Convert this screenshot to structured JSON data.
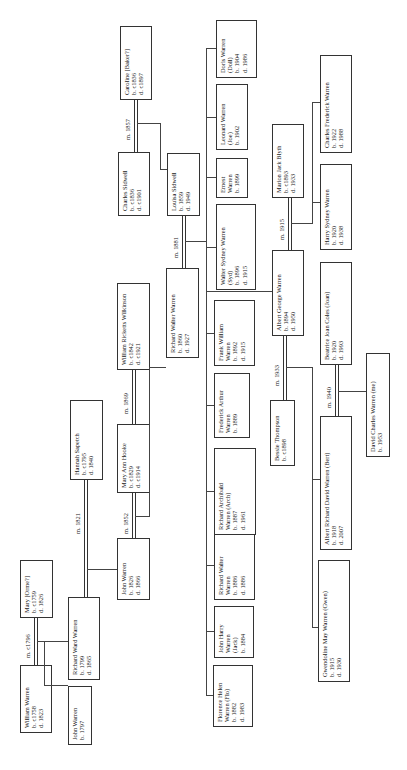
{
  "diagram": {
    "type": "family-tree",
    "orientation": "rotated 90 degrees counter-clockwise",
    "people": [
      {
        "id": "caroline",
        "lines": [
          "Caroline [Baker?]",
          "b. c1836",
          "d. c1897"
        ]
      },
      {
        "id": "charles_sidwell",
        "lines": [
          "Charles Sidwell",
          "b. c1836",
          "d. c1901"
        ]
      },
      {
        "id": "louisa_sidwell",
        "lines": [
          "Louisa Sidwell",
          "b. 1859",
          "d. 1949"
        ]
      },
      {
        "id": "doris",
        "lines": [
          "Doris Warren",
          "(Doll)",
          "b. 1904",
          "d. 1986"
        ]
      },
      {
        "id": "leonard",
        "lines": [
          "Leonard Warren",
          "(Joe)",
          "b. 1902"
        ]
      },
      {
        "id": "ernest",
        "lines": [
          "Ernest",
          "Warren",
          "b. 1899"
        ]
      },
      {
        "id": "walter_sydney",
        "lines": [
          "Walter Sydney Warren",
          "(Syd)",
          "b. 1896",
          "d. 1915"
        ]
      },
      {
        "id": "marion",
        "lines": [
          "Marion Jack Blyth",
          "b. c1893",
          "d. 1933"
        ]
      },
      {
        "id": "charles_frederick",
        "lines": [
          "Charles Frederick Warren",
          "b. 1922",
          "d. 1988"
        ]
      },
      {
        "id": "harry_sydney",
        "lines": [
          "Harry Sydney Warren",
          "b. 1920",
          "d. 1938"
        ]
      },
      {
        "id": "william_wilkinson",
        "lines": [
          "William Ricketts Wilkinson",
          "b. c1842",
          "d. c1921"
        ]
      },
      {
        "id": "richard_walter_1860",
        "lines": [
          "Richard Walter Warren",
          "b. 1860",
          "d. 1927"
        ]
      },
      {
        "id": "albert_george",
        "lines": [
          "Albert George Warren",
          "b. 1894",
          "d. 1950"
        ]
      },
      {
        "id": "frank_william",
        "lines": [
          "Frank William",
          "Warren",
          "b. 1892",
          "d. 1915"
        ]
      },
      {
        "id": "frederick_arthur",
        "lines": [
          "Frederick Arthur",
          "Warren",
          "b. 1889"
        ]
      },
      {
        "id": "richard_archibald",
        "lines": [
          "Richard Archibald",
          "Warren (Arch)",
          "b. 1887",
          "d. 1961"
        ]
      },
      {
        "id": "mary_ann_hooke",
        "lines": [
          "Mary Ann Hooke",
          "b. c1829",
          "d. c1914"
        ]
      },
      {
        "id": "hannah",
        "lines": [
          "Hannah Sapetch",
          "b. c1795",
          "d. 1840"
        ]
      },
      {
        "id": "john_1826",
        "lines": [
          "John Warren",
          "b. 1826",
          "d. 1866"
        ]
      },
      {
        "id": "mary_orme",
        "lines": [
          "Mary [Orme?]",
          "b. c1759",
          "d. 1826"
        ]
      },
      {
        "id": "richard_ward",
        "lines": [
          "Richard Ward Warren",
          "b. 1799",
          "d. 1865"
        ]
      },
      {
        "id": "william_warren",
        "lines": [
          "William Warren",
          "b. c1758",
          "d. 1823"
        ]
      },
      {
        "id": "john_1797",
        "lines": [
          "John Warren",
          "b. 1797"
        ]
      },
      {
        "id": "richard_walter_1886",
        "lines": [
          "Richard Walter",
          "Warren",
          "b. 1886",
          "d. 1886"
        ]
      },
      {
        "id": "john_harry",
        "lines": [
          "John Harry",
          "Warren",
          "(Jack)",
          "b. 1884"
        ]
      },
      {
        "id": "florence",
        "lines": [
          "Florence Helen",
          "Warren (Flo)",
          "b. 1882",
          "d. 1983"
        ]
      },
      {
        "id": "bessie",
        "lines": [
          "Bessie Thompson",
          "b. c1898"
        ]
      },
      {
        "id": "beatrice",
        "lines": [
          "Beatrice Joan Coles (Joan)",
          "b. 1920",
          "d. 1993"
        ]
      },
      {
        "id": "david_charles",
        "lines": [
          "David Charles Warren (me)",
          "b. 1953"
        ]
      },
      {
        "id": "albert_richard",
        "lines": [
          "Albert Richard David Warren (Bert)",
          "b. 1918",
          "d. 2007"
        ]
      },
      {
        "id": "gwendoline",
        "lines": [
          "Gwendoline May Warren (Gwen)",
          "b. 1915",
          "d. 1930"
        ]
      }
    ],
    "marriages": [
      {
        "label": "m. c1796",
        "spouses": [
          "william_warren",
          "mary_orme"
        ]
      },
      {
        "label": "m. 1821",
        "spouses": [
          "richard_ward",
          "hannah"
        ]
      },
      {
        "label": "m. 1852",
        "spouses": [
          "john_1826",
          "mary_ann_hooke"
        ]
      },
      {
        "label": "m. 1869",
        "spouses": [
          "mary_ann_hooke",
          "william_wilkinson"
        ]
      },
      {
        "label": "m. 1857",
        "spouses": [
          "charles_sidwell",
          "caroline"
        ]
      },
      {
        "label": "m. 1881",
        "spouses": [
          "richard_walter_1860",
          "louisa_sidwell"
        ]
      },
      {
        "label": "m. 1915",
        "spouses": [
          "albert_george",
          "marion"
        ]
      },
      {
        "label": "m. 1933",
        "spouses": [
          "bessie",
          "albert_george"
        ]
      },
      {
        "label": "m. 1940",
        "spouses": [
          "albert_richard",
          "beatrice"
        ]
      }
    ]
  }
}
